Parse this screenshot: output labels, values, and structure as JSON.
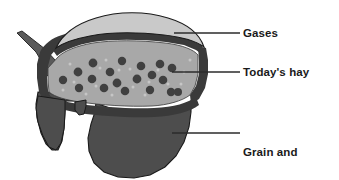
{
  "figure": {
    "type": "cutaway-diagram",
    "background_color": "#ffffff"
  },
  "labels": [
    {
      "id": "gases",
      "text": "Gases",
      "leader": {
        "x1": 174,
        "y1": 33,
        "x2": 240,
        "y2": 33
      }
    },
    {
      "id": "todays_hay",
      "text": "Today's hay",
      "leader": {
        "x1": 172,
        "y1": 72,
        "x2": 240,
        "y2": 72
      }
    },
    {
      "id": "grain_and_yesterdays_hay",
      "line1": "Grain and",
      "line2": "yesterday's hay",
      "leader": {
        "x1": 172,
        "y1": 133,
        "x2": 240,
        "y2": 133
      }
    }
  ],
  "regions": [
    {
      "id": "gases",
      "label": "Gases",
      "fill": "#c9c9c9",
      "stroke": "#1a1a1a"
    },
    {
      "id": "todays_hay",
      "label": "Today's hay",
      "fill": "#a8a8a8",
      "stroke": "#3a3a3a",
      "dot_fill": "#404040",
      "speck_fill": "#c4c4c4"
    },
    {
      "id": "grain_and_yesterdays_hay",
      "label": "Grain and yesterday's hay",
      "fill": "#4d4d4d",
      "stroke": "#1a1a1a"
    },
    {
      "id": "rumen_wall",
      "label": "rumen wall",
      "fill": "#3a3a3a"
    },
    {
      "id": "esophagus",
      "label": "esophagus",
      "fill": "#5a5a5a",
      "stroke": "#2a2a2a"
    }
  ],
  "colors": {
    "label_text": "#1a1a1a",
    "leader_line": "#2b2b2b",
    "gases_fill": "#c9c9c9",
    "hay_fill": "#a8a8a8",
    "hay_dot": "#404040",
    "grain_fill": "#4d4d4d",
    "wall_fill": "#3a3a3a",
    "outline": "#1a1a1a"
  },
  "hay_particles": [
    {
      "cx": 63,
      "cy": 80,
      "r": 4.2
    },
    {
      "cx": 78,
      "cy": 72,
      "r": 4.4
    },
    {
      "cx": 79,
      "cy": 88,
      "r": 4.2
    },
    {
      "cx": 93,
      "cy": 63,
      "r": 4.4
    },
    {
      "cx": 92,
      "cy": 79,
      "r": 4.3
    },
    {
      "cx": 104,
      "cy": 88,
      "r": 4.3
    },
    {
      "cx": 110,
      "cy": 72,
      "r": 4.3
    },
    {
      "cx": 117,
      "cy": 83,
      "r": 4.4
    },
    {
      "cx": 122,
      "cy": 61,
      "r": 4.2
    },
    {
      "cx": 125,
      "cy": 91,
      "r": 4.3
    },
    {
      "cx": 137,
      "cy": 79,
      "r": 4.4
    },
    {
      "cx": 141,
      "cy": 66,
      "r": 4.3
    },
    {
      "cx": 150,
      "cy": 90,
      "r": 4.2
    },
    {
      "cx": 152,
      "cy": 75,
      "r": 4.3
    },
    {
      "cx": 160,
      "cy": 64,
      "r": 4.3
    },
    {
      "cx": 163,
      "cy": 80,
      "r": 4.3
    },
    {
      "cx": 171,
      "cy": 92,
      "r": 4.2
    },
    {
      "cx": 178,
      "cy": 92,
      "r": 4.0
    },
    {
      "cx": 172,
      "cy": 68,
      "r": 4.3
    }
  ],
  "hay_specks": [
    {
      "cx": 70,
      "cy": 64
    },
    {
      "cx": 86,
      "cy": 94
    },
    {
      "cx": 100,
      "cy": 68
    },
    {
      "cx": 112,
      "cy": 95
    },
    {
      "cx": 130,
      "cy": 69
    },
    {
      "cx": 145,
      "cy": 95
    },
    {
      "cx": 158,
      "cy": 70
    },
    {
      "cx": 168,
      "cy": 84
    },
    {
      "cx": 184,
      "cy": 72
    },
    {
      "cx": 96,
      "cy": 86
    },
    {
      "cx": 133,
      "cy": 87
    },
    {
      "cx": 74,
      "cy": 82
    },
    {
      "cx": 119,
      "cy": 70
    },
    {
      "cx": 149,
      "cy": 82
    },
    {
      "cx": 181,
      "cy": 84
    }
  ]
}
